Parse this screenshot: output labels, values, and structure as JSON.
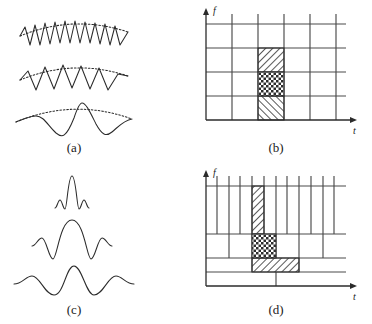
{
  "figure": {
    "panels": [
      {
        "id": "a",
        "caption": "(a)",
        "kind": "waveforms",
        "description": "Three windowed sinusoids of constant envelope width and increasing period",
        "envelope": "dotted arc",
        "waves": [
          {
            "name": "high-frequency-wave",
            "cycles": 8,
            "amplitude": 13,
            "width": 118
          },
          {
            "name": "medium-frequency-wave",
            "cycles": 5,
            "amplitude": 13,
            "width": 118
          },
          {
            "name": "low-frequency-wave",
            "cycles": 2.5,
            "amplitude": 13,
            "width": 118
          }
        ]
      },
      {
        "id": "b",
        "caption": "(b)",
        "kind": "tiling",
        "description": "Uniform rectangular time-frequency grid of the short-time Fourier transform",
        "axes": {
          "x_label": "t",
          "y_label": "f"
        },
        "grid": {
          "columns": 6,
          "rows": 4,
          "uniform": true
        },
        "highlight": {
          "name": "highlighted-column",
          "column_index": 2,
          "cells": [
            {
              "row": 3,
              "fill": "diagonal-hatch-right"
            },
            {
              "row": 2,
              "fill": "cross-hatch"
            },
            {
              "row": 1,
              "fill": "diagonal-hatch-left"
            }
          ]
        }
      },
      {
        "id": "c",
        "caption": "(c)",
        "kind": "wavelets",
        "description": "Three wavelets: dilated copies of a single mother wavelet with decreasing amplitude",
        "waves": [
          {
            "name": "narrow-wavelet",
            "width": 42,
            "amplitude": 25
          },
          {
            "name": "medium-wavelet",
            "width": 86,
            "amplitude": 19
          },
          {
            "name": "wide-wavelet",
            "width": 150,
            "amplitude": 13
          }
        ]
      },
      {
        "id": "d",
        "caption": "(d)",
        "kind": "tiling",
        "description": "Dyadic wavelet time-frequency tiling: tall narrow tiles at high frequency, short wide tiles at low frequency",
        "axes": {
          "x_label": "t",
          "y_label": "f"
        },
        "bands": [
          {
            "name": "high-frequency-band",
            "divisions": 12
          },
          {
            "name": "mid-frequency-band",
            "divisions": 6
          },
          {
            "name": "low-frequency-band",
            "divisions": 3
          },
          {
            "name": "lowest-frequency-band",
            "divisions": 1
          }
        ],
        "highlight": {
          "name": "highlighted-tiles",
          "cells": [
            {
              "band": "high-frequency-band",
              "fill": "diagonal-hatch-right"
            },
            {
              "band": "mid-frequency-band",
              "fill": "cross-hatch"
            },
            {
              "band": "low-frequency-band",
              "fill": "diagonal-hatch-right"
            }
          ]
        }
      }
    ],
    "colors": {
      "stroke": "#2b2b2b",
      "grid": "#4a4a4a",
      "background": "#ffffff",
      "hatch": "#2e2e2e"
    }
  }
}
